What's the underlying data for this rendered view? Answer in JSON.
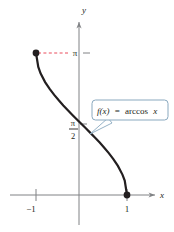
{
  "figure": {
    "kind": "function-graph",
    "background_color": "#ffffff"
  },
  "axes": {
    "x_axis_label": "x",
    "y_axis_label": "y",
    "x_ticks": [
      {
        "label": "−1",
        "value": -1
      },
      {
        "label": "1",
        "value": 1
      }
    ],
    "y_ticks": [
      {
        "label": "π",
        "value": 3.14159
      },
      {
        "label_numerator": "π",
        "label_denominator": "2",
        "value": 1.5708
      }
    ],
    "axis_color": "#808285",
    "grid": false
  },
  "callout": {
    "text_fx": "f(x)",
    "text_equals": "=",
    "text_expression": "arccos",
    "text_variable": "x",
    "full_label": "f(x) = arccos x",
    "border_color": "#8aa9bf",
    "fill_color": "#ffffff"
  },
  "annotations": {
    "dashed_guide_color": "#e8394a",
    "dashed_guide_from": "(-1, π)",
    "dashed_guide_to": "π tick on y-axis"
  },
  "chart_data": {
    "type": "line",
    "title": "",
    "subtitle": "",
    "xlabel": "x",
    "ylabel": "y",
    "xlim": [
      -1.55,
      1.65
    ],
    "ylim": [
      -0.55,
      3.95
    ],
    "grid": false,
    "legend_position": "inline-callout",
    "series": [
      {
        "name": "f(x) = arccos x",
        "color": "#231f20",
        "linewidth": 2.2,
        "x": [
          -1.0,
          -0.95,
          -0.9,
          -0.8,
          -0.7,
          -0.6,
          -0.5,
          -0.4,
          -0.3,
          -0.2,
          -0.1,
          0.0,
          0.1,
          0.2,
          0.3,
          0.4,
          0.5,
          0.6,
          0.7,
          0.8,
          0.9,
          0.95,
          1.0
        ],
        "y": [
          3.1416,
          2.8342,
          2.6906,
          2.4981,
          2.3462,
          2.2143,
          2.0944,
          1.9823,
          1.8755,
          1.7722,
          1.671,
          1.5708,
          1.4706,
          1.3694,
          1.2661,
          1.1593,
          1.0472,
          0.9273,
          0.7954,
          0.6435,
          0.451,
          0.3176,
          0.0
        ]
      }
    ],
    "endpoints": [
      {
        "label": "(-1, π)",
        "x": -1,
        "y": 3.14159,
        "marker": "filled-circle"
      },
      {
        "label": "(1, 0)",
        "x": 1,
        "y": 0,
        "marker": "filled-circle"
      }
    ],
    "annotations": [
      {
        "text": "f(x) = arccos x",
        "type": "callout",
        "points_to_x": 0.12,
        "points_to_y": 1.45
      }
    ]
  }
}
